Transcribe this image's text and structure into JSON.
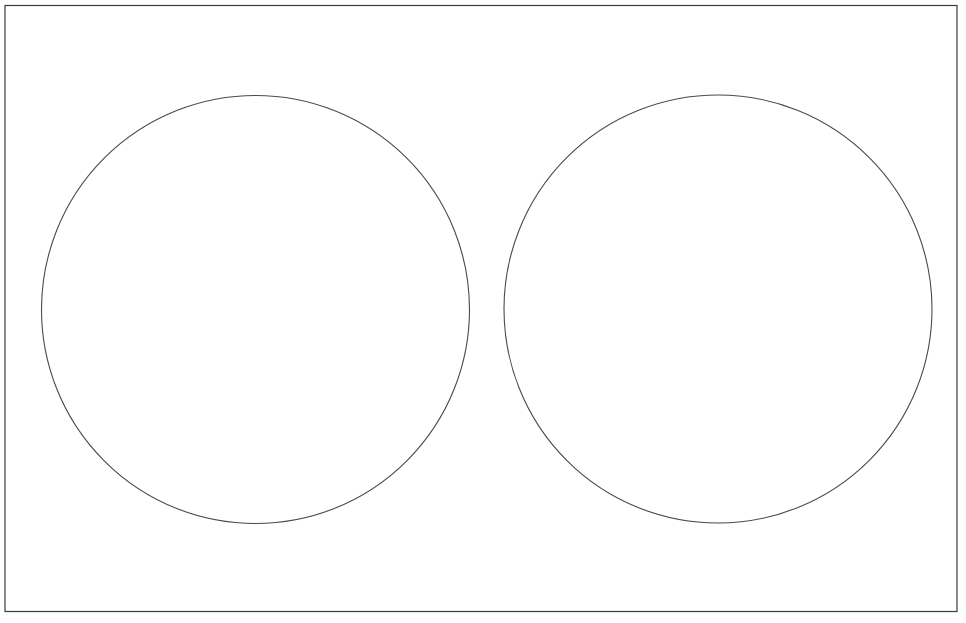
{
  "canvas": {
    "width": 966,
    "height": 623,
    "background_color": "#ffffff",
    "title": "Two Circles Figure"
  },
  "frame": {
    "name": "outer-border-rectangle",
    "x": 5,
    "y": 5.5,
    "width": 952,
    "height": 606,
    "stroke_color": "#3b3b3b",
    "stroke_width": 1.2,
    "fill": "none"
  },
  "shapes": [
    {
      "name": "left-circle",
      "type": "circle",
      "cx": 255.5,
      "cy": 309.5,
      "r": 214,
      "stroke_color": "#4a4a4a",
      "stroke_width": 1.1,
      "fill": "none"
    },
    {
      "name": "right-circle",
      "type": "circle",
      "cx": 718,
      "cy": 309,
      "r": 214,
      "stroke_color": "#4a4a4a",
      "stroke_width": 1.1,
      "fill": "none"
    }
  ]
}
